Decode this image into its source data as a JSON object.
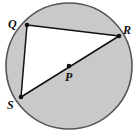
{
  "figure": {
    "type": "geometry-diagram",
    "canvas": {
      "width": 138,
      "height": 133,
      "background": "#ffffff"
    },
    "circle": {
      "name": "circle-p",
      "center_label": "P",
      "cx": 69,
      "cy": 66,
      "r": 63,
      "stroke": "#555555",
      "stroke_width": 1.6,
      "shaded_fill": "#c9c9c9",
      "unshaded_fill": "#ffffff"
    },
    "points": [
      {
        "id": "Q",
        "label": "Q",
        "x": 27,
        "y": 25,
        "label_x": 8,
        "label_y": 28,
        "dot": true
      },
      {
        "id": "R",
        "label": "R",
        "x": 119,
        "y": 36,
        "label_x": 123,
        "label_y": 34,
        "dot": true
      },
      {
        "id": "S",
        "label": "S",
        "x": 21,
        "y": 97,
        "label_x": 7,
        "label_y": 109,
        "dot": true
      },
      {
        "id": "P",
        "label": "P",
        "x": 69,
        "y": 66,
        "label_x": 65,
        "label_y": 81,
        "dot": true
      }
    ],
    "segments": [
      {
        "id": "QR",
        "from": "Q",
        "to": "R",
        "x1": 27,
        "y1": 25,
        "x2": 119,
        "y2": 36
      },
      {
        "id": "QS",
        "from": "Q",
        "to": "S",
        "x1": 27,
        "y1": 25,
        "x2": 21,
        "y2": 97
      },
      {
        "id": "SR",
        "from": "S",
        "to": "R",
        "x1": 21,
        "y1": 97,
        "x2": 119,
        "y2": 36,
        "is_diameter": true,
        "passes_through": "P"
      }
    ],
    "regions": [
      {
        "id": "triangle-QRS",
        "shaded": false,
        "description": "interior of inscribed triangle QRS"
      },
      {
        "id": "segment-major",
        "shaded": true,
        "description": "circle area outside triangle QRS"
      }
    ],
    "dot": {
      "radius": 2.3,
      "fill": "#111111"
    }
  }
}
